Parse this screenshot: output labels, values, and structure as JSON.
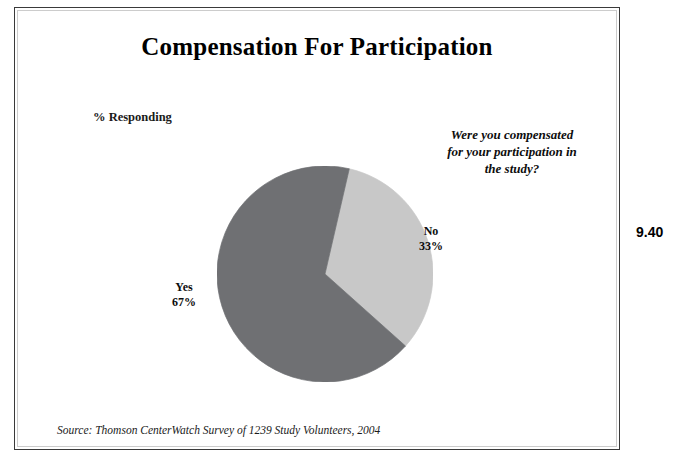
{
  "slide": {
    "title": "Compensation For Participation",
    "axis_note": "% Responding",
    "question_line_1": "Were you compensated",
    "question_line_2": "for your participation in",
    "question_line_3": "the study?",
    "source": "Source: Thomson CenterWatch Survey of 1239 Study Volunteers, 2004",
    "page_number": "9.40",
    "frame_color": "#3a3a3a"
  },
  "labels": {
    "no_name": "No",
    "no_value": "33%",
    "yes_name": "Yes",
    "yes_value": "67%"
  },
  "chart_data": {
    "type": "pie",
    "title": "Compensation For Participation",
    "subtitle": "Were you compensated for your participation in the study?",
    "ylabel": "% Responding",
    "categories": [
      "Yes",
      "No"
    ],
    "values": [
      67,
      33
    ],
    "value_unit": "%",
    "colors": [
      "#6f7073",
      "#c8c8c8"
    ],
    "labels": [
      "Yes 67%",
      "No 33%"
    ],
    "start_angle_deg": 13,
    "direction": "clockwise",
    "legend": "none",
    "data_labels": true,
    "source": "Thomson CenterWatch Survey of 1239 Study Volunteers, 2004",
    "sample_size": 1239,
    "survey_year": 2004
  }
}
